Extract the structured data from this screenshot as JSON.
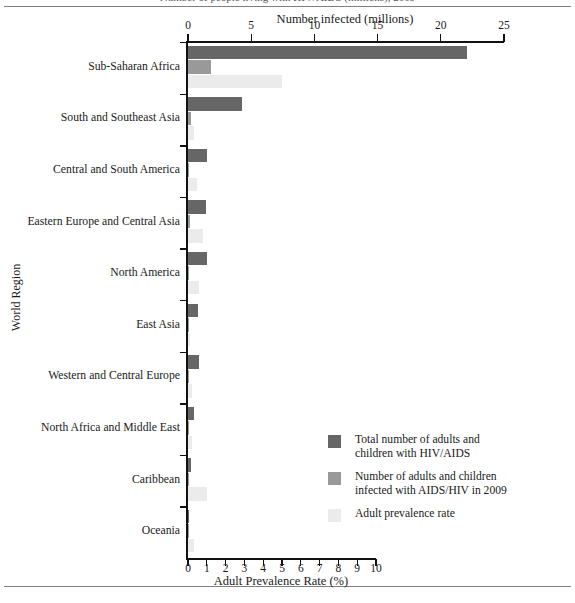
{
  "figure": {
    "cropped_title": "Number of people living with HIV/AIDS (millions), 2009",
    "rules": [
      "top",
      "bottom"
    ]
  },
  "chart_data": {
    "type": "bar",
    "orientation": "horizontal",
    "title": "",
    "ylabel": "World Region",
    "categories": [
      "Sub-Saharan Africa",
      "South and Southeast Asia",
      "Central and South America",
      "Eastern Europe and Central Asia",
      "North America",
      "East Asia",
      "Western and Central Europe",
      "North Africa and Middle East",
      "Caribbean",
      "Oceania"
    ],
    "top_axis": {
      "label": "Number infected (millions)",
      "ticks": [
        0,
        5,
        10,
        15,
        20,
        25
      ],
      "range": [
        0,
        25
      ]
    },
    "bottom_axis": {
      "label": "Adult Prevalence Rate (%)",
      "ticks": [
        0,
        1,
        2,
        3,
        4,
        5,
        6,
        7,
        8,
        9,
        10
      ],
      "range": [
        0,
        10
      ]
    },
    "grid": false,
    "legend_position": "inside-lower-right",
    "series": [
      {
        "name": "Total number of adults and\nchildren with HIV/AIDS",
        "key": "total_infected",
        "color": "#666666",
        "axis": "top",
        "unit": "millions",
        "values": [
          22.1,
          4.3,
          1.5,
          1.4,
          1.5,
          0.8,
          0.85,
          0.46,
          0.24,
          0.06
        ]
      },
      {
        "name": "Number of adults and children\ninfected with AIDS/HIV in 2009",
        "key": "new_infections_2009",
        "color": "#999999",
        "axis": "top",
        "unit": "millions",
        "values": [
          1.8,
          0.27,
          0.092,
          0.13,
          0.07,
          0.082,
          0.031,
          0.075,
          0.017,
          0.004
        ]
      },
      {
        "name": "Adult prevalence rate",
        "key": "adult_prevalence_rate",
        "color": "#ebebeb",
        "axis": "bottom",
        "unit": "%",
        "values": [
          5.0,
          0.3,
          0.5,
          0.8,
          0.6,
          0.1,
          0.2,
          0.2,
          1.0,
          0.3
        ]
      }
    ]
  },
  "legend": {
    "items": [
      {
        "label": "Total number of adults and\nchildren with HIV/AIDS",
        "color": "#666666"
      },
      {
        "label": "Number of adults and children\ninfected with AIDS/HIV in 2009",
        "color": "#999999"
      },
      {
        "label": "Adult prevalence rate",
        "color": "#ebebeb"
      }
    ]
  }
}
